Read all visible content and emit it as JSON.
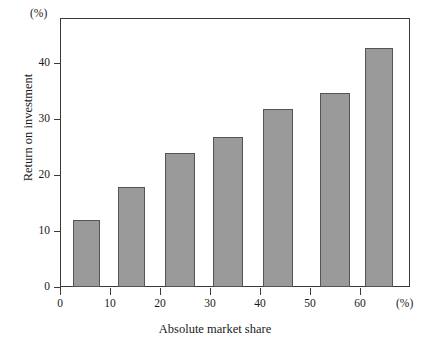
{
  "chart_data": {
    "type": "bar",
    "title": "",
    "subtitle": "",
    "xlabel": "Absolute market share",
    "ylabel": "Return on investment",
    "x_unit": "(%)",
    "y_unit": "(%)",
    "xlim": [
      0,
      70
    ],
    "ylim": [
      0,
      48
    ],
    "grid": false,
    "legend": null,
    "x_ticks": [
      {
        "value": 0,
        "label": "0"
      },
      {
        "value": 10,
        "label": "10"
      },
      {
        "value": 20,
        "label": "20"
      },
      {
        "value": 30,
        "label": "30"
      },
      {
        "value": 40,
        "label": "40"
      },
      {
        "value": 50,
        "label": "50"
      },
      {
        "value": 60,
        "label": "60"
      }
    ],
    "y_ticks": [
      {
        "value": 0,
        "label": "0"
      },
      {
        "value": 10,
        "label": "10"
      },
      {
        "value": 20,
        "label": "20"
      },
      {
        "value": 30,
        "label": "30"
      },
      {
        "value": 40,
        "label": "40"
      }
    ],
    "bar_color": "#9a9a9a",
    "bar_edge_color": "#545454",
    "axis_color": "#3a3a3a",
    "categories": [
      "0-10",
      "10-20",
      "20-30",
      "30-40",
      "40-50",
      "50-60",
      "60-70"
    ],
    "bars": [
      {
        "x_start": 2.5,
        "x_end": 8.0,
        "value": 11.9,
        "label": "11.9"
      },
      {
        "x_start": 11.5,
        "x_end": 17.0,
        "value": 17.9,
        "label": "17.9"
      },
      {
        "x_start": 21.0,
        "x_end": 27.0,
        "value": 23.9,
        "label": "23.9"
      },
      {
        "x_start": 30.5,
        "x_end": 36.5,
        "value": 26.7,
        "label": "26.7"
      },
      {
        "x_start": 40.5,
        "x_end": 46.5,
        "value": 31.7,
        "label": "31.7"
      },
      {
        "x_start": 52.0,
        "x_end": 58.0,
        "value": 34.6,
        "label": "34.6"
      },
      {
        "x_start": 61.0,
        "x_end": 66.5,
        "value": 42.6,
        "label": "42.6"
      }
    ],
    "values": [
      11.9,
      17.9,
      23.9,
      26.7,
      31.7,
      34.6,
      42.6
    ]
  }
}
